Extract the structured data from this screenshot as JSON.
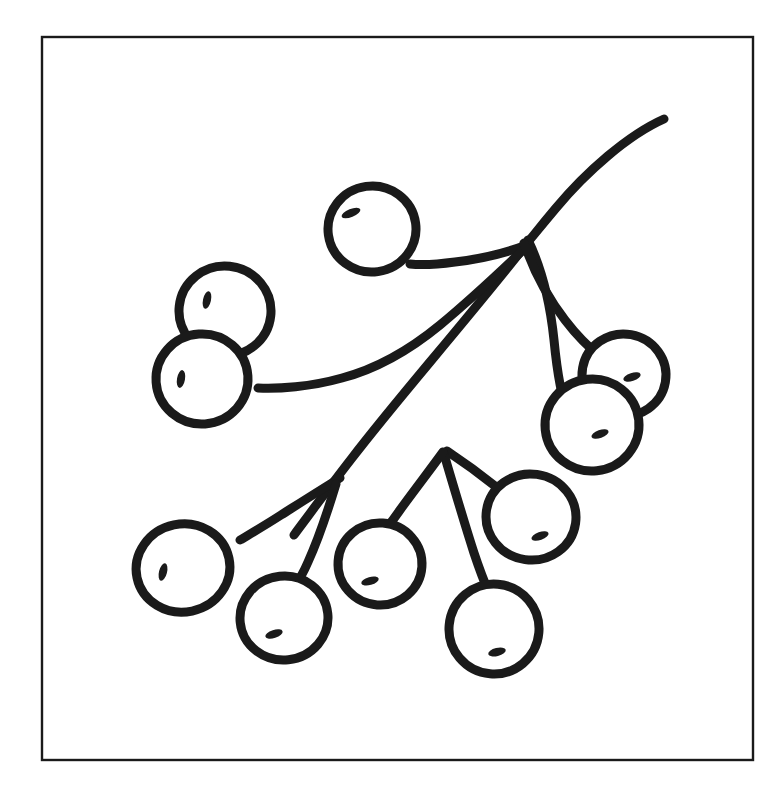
{
  "document": {
    "kind": "line-art-illustration",
    "subject": "berry-branch",
    "style": "coloring-page-outline",
    "canvas_width": 765,
    "canvas_height": 790,
    "background_color": "#ffffff",
    "ink_color": "#1a1a1a",
    "fill_color": "#ffffff"
  },
  "frame": {
    "name": "page-border",
    "x": 42,
    "y": 37,
    "width": 711,
    "height": 723,
    "stroke_color": "#1a1a1a",
    "stroke_width": 2.4
  },
  "stems": {
    "stroke_color": "#1a1a1a",
    "main": {
      "label": "main-stem",
      "stroke_width": 9,
      "path": "M 664 119 C 628 135 586 172 556 208 C 540 227 533 236 528 242 C 512 263 470 314 430 362 C 400 398 372 432 352 458 C 338 476 326 492 314 508 C 306 519 299 528 294 535"
    },
    "branches": [
      {
        "label": "stem-to-top-berry",
        "stroke_width": 9,
        "path": "M 524 246 C 505 253 480 259 455 262 C 433 265 419 265 410 264"
      },
      {
        "label": "stem-to-left-cluster",
        "stroke_width": 9,
        "path": "M 523 250 C 500 272 470 300 440 325 C 412 348 380 368 342 378 C 310 387 278 389 258 388"
      },
      {
        "label": "stem-right-outer-arc",
        "stroke_width": 9,
        "path": "M 528 240 C 544 273 551 311 554 340 C 557 371 561 397 568 412"
      },
      {
        "label": "stem-right-inner-arc",
        "stroke_width": 9,
        "path": "M 524 243 C 534 272 548 298 565 320 C 578 337 592 350 601 357"
      },
      {
        "label": "stem-to-middle-right-berry",
        "stroke_width": 9,
        "path": "M 447 451 C 462 461 480 474 495 486 C 505 494 512 499 517 503"
      },
      {
        "label": "stem-to-bottom-berry",
        "stroke_width": 9,
        "path": "M 444 454 C 452 481 464 522 474 553 C 481 574 486 586 489 593"
      },
      {
        "label": "stem-to-middle-berry",
        "stroke_width": 9,
        "path": "M 443 452 C 430 470 413 492 400 510 C 391 523 385 530 382 534"
      },
      {
        "label": "stem-to-bottom-left-berry",
        "stroke_width": 9,
        "path": "M 340 478 C 322 489 300 503 281 515 C 264 526 250 534 240 540"
      },
      {
        "label": "stem-to-second-bottom-berry",
        "stroke_width": 9,
        "path": "M 336 484 C 329 507 318 540 308 562 C 302 576 297 583 294 587"
      }
    ]
  },
  "berries": [
    {
      "name": "berry-top",
      "cx": 372,
      "cy": 229,
      "rx": 44,
      "ry": 43,
      "rotate": -8,
      "stroke_width": 9,
      "highlight": {
        "cx": 351,
        "cy": 213,
        "rx": 10,
        "ry": 4,
        "rotate": -22
      }
    },
    {
      "name": "berry-upper-left",
      "cx": 225,
      "cy": 311,
      "rx": 46,
      "ry": 45,
      "rotate": 6,
      "stroke_width": 9,
      "highlight": {
        "cx": 207,
        "cy": 300,
        "rx": 4,
        "ry": 9,
        "rotate": 12
      }
    },
    {
      "name": "berry-lower-left",
      "cx": 202,
      "cy": 379,
      "rx": 46,
      "ry": 45,
      "rotate": -4,
      "stroke_width": 9,
      "highlight": {
        "cx": 181,
        "cy": 379,
        "rx": 4,
        "ry": 9,
        "rotate": 10
      }
    },
    {
      "name": "berry-right-upper",
      "cx": 624,
      "cy": 375,
      "rx": 42,
      "ry": 41,
      "rotate": 10,
      "stroke_width": 9,
      "highlight": {
        "cx": 632,
        "cy": 377,
        "rx": 9,
        "ry": 4,
        "rotate": -18
      }
    },
    {
      "name": "berry-right-lower",
      "cx": 592,
      "cy": 425,
      "rx": 47,
      "ry": 46,
      "rotate": -6,
      "stroke_width": 9,
      "highlight": {
        "cx": 600,
        "cy": 434,
        "rx": 9,
        "ry": 4,
        "rotate": -20
      }
    },
    {
      "name": "berry-middle-right",
      "cx": 531,
      "cy": 517,
      "rx": 45,
      "ry": 43,
      "rotate": 8,
      "stroke_width": 9,
      "highlight": {
        "cx": 540,
        "cy": 536,
        "rx": 9,
        "ry": 4,
        "rotate": -20
      }
    },
    {
      "name": "berry-bottom-left",
      "cx": 183,
      "cy": 568,
      "rx": 47,
      "ry": 44,
      "rotate": -12,
      "stroke_width": 9,
      "highlight": {
        "cx": 163,
        "cy": 572,
        "rx": 4,
        "ry": 9,
        "rotate": 14
      }
    },
    {
      "name": "berry-middle",
      "cx": 380,
      "cy": 564,
      "rx": 42,
      "ry": 41,
      "rotate": 4,
      "stroke_width": 9,
      "highlight": {
        "cx": 370,
        "cy": 581,
        "rx": 9,
        "ry": 4,
        "rotate": -16
      }
    },
    {
      "name": "berry-second-bottom",
      "cx": 284,
      "cy": 618,
      "rx": 44,
      "ry": 42,
      "rotate": -6,
      "stroke_width": 9,
      "highlight": {
        "cx": 274,
        "cy": 634,
        "rx": 9,
        "ry": 4,
        "rotate": -18
      }
    },
    {
      "name": "berry-bottom",
      "cx": 494,
      "cy": 629,
      "rx": 45,
      "ry": 45,
      "rotate": 5,
      "stroke_width": 9,
      "highlight": {
        "cx": 497,
        "cy": 652,
        "rx": 9,
        "ry": 4,
        "rotate": -14
      }
    }
  ],
  "counts": {
    "berry_total": 10,
    "stem_branch_total": 9
  }
}
